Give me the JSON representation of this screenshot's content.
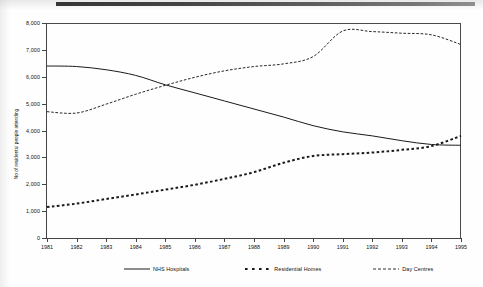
{
  "figure": {
    "background_color": "#ffffff",
    "axis_color": "#444444",
    "scan_artifact": "dark-bar-top-edge"
  },
  "chart_data": {
    "type": "line",
    "title": "",
    "subtitle": "",
    "xlabel": "",
    "ylabel": "No of residents/ people attending",
    "x": [
      1981,
      1982,
      1983,
      1984,
      1985,
      1986,
      1987,
      1988,
      1989,
      1990,
      1991,
      1992,
      1993,
      1994,
      1995
    ],
    "xtick_labels": [
      "1981",
      "1982",
      "1983",
      "1984",
      "1985",
      "1986",
      "1987",
      "1988",
      "1989",
      "1990",
      "1991",
      "1992",
      "1993",
      "1994",
      "1995"
    ],
    "ytick_labels": [
      "0",
      "1,000",
      "2,000",
      "3,000",
      "4,000",
      "5,000",
      "6,000",
      "7,000",
      "8,000"
    ],
    "ytick_values": [
      0,
      1000,
      2000,
      3000,
      4000,
      5000,
      6000,
      7000,
      8000
    ],
    "ylim": [
      0,
      8000
    ],
    "xlim": [
      1981,
      1995
    ],
    "grid": false,
    "legend_position": "bottom",
    "series": [
      {
        "name": "NHS Hospitals",
        "style": "solid",
        "color": "#1a1a1a",
        "values": [
          6400,
          6380,
          6260,
          6050,
          5700,
          5400,
          5100,
          4800,
          4500,
          4180,
          3950,
          3800,
          3620,
          3480,
          3450
        ]
      },
      {
        "name": "Residential Homes",
        "style": "thick-dashed",
        "color": "#1a1a1a",
        "values": [
          1150,
          1280,
          1450,
          1620,
          1800,
          1980,
          2200,
          2450,
          2800,
          3050,
          3120,
          3180,
          3280,
          3420,
          3800
        ]
      },
      {
        "name": "Day Centres",
        "style": "fine-dashed",
        "color": "#1a1a1a",
        "values": [
          4700,
          4650,
          4980,
          5350,
          5680,
          5980,
          6220,
          6380,
          6480,
          6750,
          7700,
          7680,
          7620,
          7560,
          7200
        ]
      }
    ],
    "annotations": []
  },
  "legend": {
    "items": [
      {
        "label": "NHS Hospitals",
        "style": "solid"
      },
      {
        "label": "Residential Homes",
        "style": "thick-dashed"
      },
      {
        "label": "Day Centres",
        "style": "fine-dashed"
      }
    ]
  }
}
